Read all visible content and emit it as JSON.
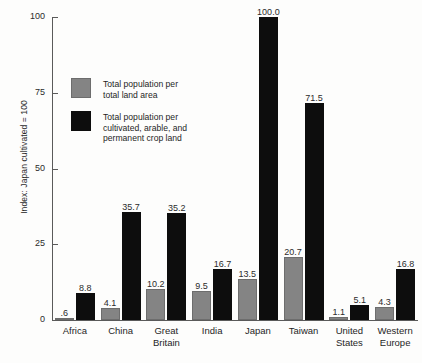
{
  "chart_data": {
    "type": "bar",
    "title": "",
    "subtitle": "",
    "xlabel": "",
    "ylabel": "Index: Japan cultivated = 100",
    "ylim": [
      0,
      100
    ],
    "yticks": [
      0,
      25,
      50,
      75,
      100
    ],
    "ytick_labels": [
      "0",
      "25",
      "50",
      "75",
      "100"
    ],
    "grid": false,
    "legend_position": "inside-upper-left",
    "categories": [
      "Africa",
      "China",
      "Great Britain",
      "India",
      "Japan",
      "Taiwan",
      "United States",
      "Western Europe"
    ],
    "series": [
      {
        "name": "Total population per total land area",
        "color": "#848484",
        "values": [
          0.6,
          4.1,
          10.2,
          9.5,
          13.5,
          20.7,
          1.1,
          4.3
        ],
        "labels": [
          ".6",
          "4.1",
          "10.2",
          "9.5",
          "13.5",
          "20.7",
          "1.1",
          "4.3"
        ]
      },
      {
        "name": "Total population per cultivated, arable, and permanent crop land",
        "color": "#0d0d0d",
        "values": [
          8.8,
          35.7,
          35.2,
          16.7,
          100.0,
          71.5,
          5.1,
          16.8
        ],
        "labels": [
          "8.8",
          "35.7",
          "35.2",
          "16.7",
          "100.0",
          "71.5",
          "5.1",
          "16.8"
        ]
      }
    ]
  },
  "legend": {
    "items": [
      {
        "swatch": "gray",
        "label": "Total population per\ntotal land area"
      },
      {
        "swatch": "black",
        "label": "Total population per\ncultivated, arable, and\npermanent crop land"
      }
    ]
  },
  "category_lines": [
    [
      "Africa"
    ],
    [
      "China"
    ],
    [
      "Great",
      "Britain"
    ],
    [
      "India"
    ],
    [
      "Japan"
    ],
    [
      "Taiwan"
    ],
    [
      "United",
      "States"
    ],
    [
      "Western",
      "Europe"
    ]
  ]
}
